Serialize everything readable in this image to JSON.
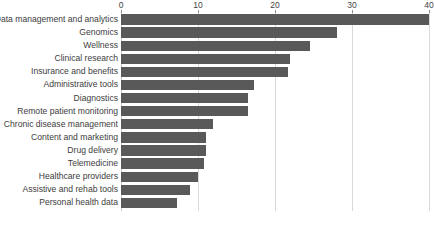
{
  "chart_data": {
    "type": "bar",
    "orientation": "horizontal",
    "title": "",
    "subtitle": "",
    "xlabel": "",
    "ylabel": "",
    "xlim": [
      0,
      40
    ],
    "ylim": null,
    "grid": true,
    "grid_axis": "x",
    "legend": false,
    "legend_position": "none",
    "axis_position": "top",
    "bar_color": "#595959",
    "gridline_color": "#d9d9d9",
    "text_color": "#3d3d3d",
    "background_color": "#ffffff",
    "xticks": [
      0,
      10,
      20,
      30,
      40
    ],
    "xtick_labels": [
      "0",
      "10",
      "20",
      "30",
      "40"
    ],
    "categories": [
      "Data management and analytics",
      "Genomics",
      "Wellness",
      "Clinical research",
      "Insurance and benefits",
      "Administrative tools",
      "Diagnostics",
      "Remote patient monitoring",
      "Chronic disease management",
      "Content and marketing",
      "Drug delivery",
      "Telemedicine",
      "Healthcare providers",
      "Assistive and rehab tools",
      "Personal health data"
    ],
    "values": [
      40,
      28,
      24.5,
      22,
      21.7,
      17.3,
      16.5,
      16.5,
      12,
      11,
      11,
      10.8,
      10,
      9,
      7.3
    ]
  }
}
